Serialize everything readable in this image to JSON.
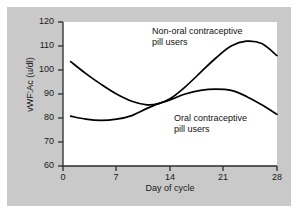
{
  "chart_data": {
    "type": "line",
    "title": "",
    "xlabel": "Day of cycle",
    "ylabel": "vWF:Ac (u/dl)",
    "xlim": [
      0,
      28
    ],
    "ylim": [
      60,
      120
    ],
    "xticks": [
      "0",
      "7",
      "14",
      "21",
      "28"
    ],
    "yticks": [
      "120",
      "110",
      "100",
      "90",
      "80",
      "70",
      "60"
    ],
    "grid": false,
    "legend_position": "inline-annotations",
    "series": [
      {
        "name": "Non-oral contraceptive pill users",
        "annotation": "Non-oral contraceptive\npill users",
        "color": "#000000",
        "x": [
          1,
          3,
          5,
          7,
          9,
          11,
          12.5,
          14,
          16,
          18,
          20,
          22,
          24,
          26,
          28
        ],
        "values": [
          103.5,
          98.5,
          94,
          90,
          87,
          85.5,
          86,
          88,
          93,
          99,
          105,
          110,
          112,
          111,
          106
        ]
      },
      {
        "name": "Oral contraceptive pill users",
        "annotation": "Oral contraceptive\npill users",
        "color": "#000000",
        "x": [
          1,
          3,
          5,
          7,
          9,
          11,
          12.5,
          14,
          16,
          18,
          20,
          22,
          24,
          26,
          28
        ],
        "values": [
          80.8,
          79.5,
          79,
          79.5,
          81,
          84,
          86,
          87.5,
          90,
          91.5,
          92,
          91.5,
          89,
          85.5,
          81.5
        ]
      }
    ]
  },
  "axes": {
    "yticks": [
      {
        "label": "120",
        "top": 17
      },
      {
        "label": "110",
        "top": 41
      },
      {
        "label": "100",
        "top": 65
      },
      {
        "label": "90",
        "top": 89
      },
      {
        "label": "80",
        "top": 113
      },
      {
        "label": "70",
        "top": 137
      },
      {
        "label": "60",
        "top": 161
      }
    ],
    "xticks": [
      {
        "label": "0",
        "left": 53
      },
      {
        "label": "7",
        "left": 106
      },
      {
        "label": "14",
        "left": 160
      },
      {
        "label": "21",
        "left": 213
      },
      {
        "label": "28",
        "left": 267
      }
    ]
  }
}
